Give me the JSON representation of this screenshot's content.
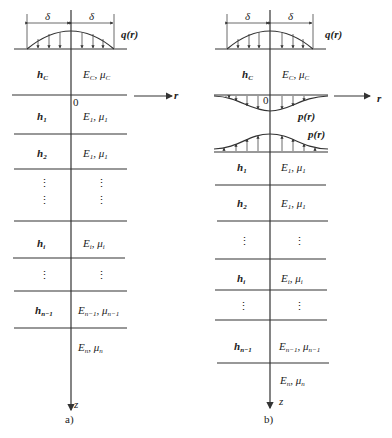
{
  "figure_a": {
    "caption": "a)",
    "delta_left": "δ",
    "delta_right": "δ",
    "load_label": "q(r)",
    "origin": "0",
    "r_axis": "r",
    "z_axis": "z",
    "layers": [
      {
        "h": "hC",
        "h_main": "h",
        "h_sub": "C",
        "E": "E",
        "E_sub": "C",
        "mu": "μ",
        "mu_sub": "C"
      },
      {
        "h_main": "h",
        "h_sub": "1",
        "E": "E",
        "E_sub": "1",
        "mu": "μ",
        "mu_sub": "1"
      },
      {
        "h_main": "h",
        "h_sub": "2",
        "E": "E",
        "E_sub": "1",
        "mu": "μ",
        "mu_sub": "1"
      },
      {
        "h_main": "⋮",
        "h_sub": "",
        "E": "⋮",
        "E_sub": "",
        "mu": "",
        "mu_sub": ""
      },
      {
        "h_main": "h",
        "h_sub": "i",
        "E": "E",
        "E_sub": "i",
        "mu": "μ",
        "mu_sub": "i"
      },
      {
        "h_main": "⋮",
        "h_sub": "",
        "E": "⋮",
        "E_sub": "",
        "mu": "",
        "mu_sub": ""
      },
      {
        "h_main": "h",
        "h_sub": "n−1",
        "E": "E",
        "E_sub": "n−1",
        "mu": "μ",
        "mu_sub": "n−1"
      },
      {
        "h_main": "",
        "h_sub": "",
        "E": "E",
        "E_sub": "n",
        "mu": "μ",
        "mu_sub": "n"
      }
    ]
  },
  "figure_b": {
    "caption": "b)",
    "delta_left": "δ",
    "delta_right": "δ",
    "load_label": "q(r)",
    "contact_label_top": "p(r)",
    "contact_label_bottom": "p(r)",
    "origin": "0",
    "r_axis": "r",
    "z_axis": "z",
    "layers": [
      {
        "h_main": "h",
        "h_sub": "C",
        "E": "E",
        "E_sub": "C",
        "mu": "μ",
        "mu_sub": "C"
      },
      {
        "h_main": "h",
        "h_sub": "1",
        "E": "E",
        "E_sub": "1",
        "mu": "μ",
        "mu_sub": "1"
      },
      {
        "h_main": "h",
        "h_sub": "2",
        "E": "E",
        "E_sub": "1",
        "mu": "μ",
        "mu_sub": "1"
      },
      {
        "h_main": "⋮",
        "h_sub": "",
        "E": "⋮",
        "E_sub": "",
        "mu": "",
        "mu_sub": ""
      },
      {
        "h_main": "h",
        "h_sub": "i",
        "E": "E",
        "E_sub": "i",
        "mu": "μ",
        "mu_sub": "i"
      },
      {
        "h_main": "⋮",
        "h_sub": "",
        "E": "⋮",
        "E_sub": "",
        "mu": "",
        "mu_sub": ""
      },
      {
        "h_main": "h",
        "h_sub": "n−1",
        "E": "E",
        "E_sub": "n−1",
        "mu": "μ",
        "mu_sub": "n−1"
      },
      {
        "h_main": "",
        "h_sub": "",
        "E": "E",
        "E_sub": "n",
        "mu": "μ",
        "mu_sub": "n"
      }
    ]
  }
}
